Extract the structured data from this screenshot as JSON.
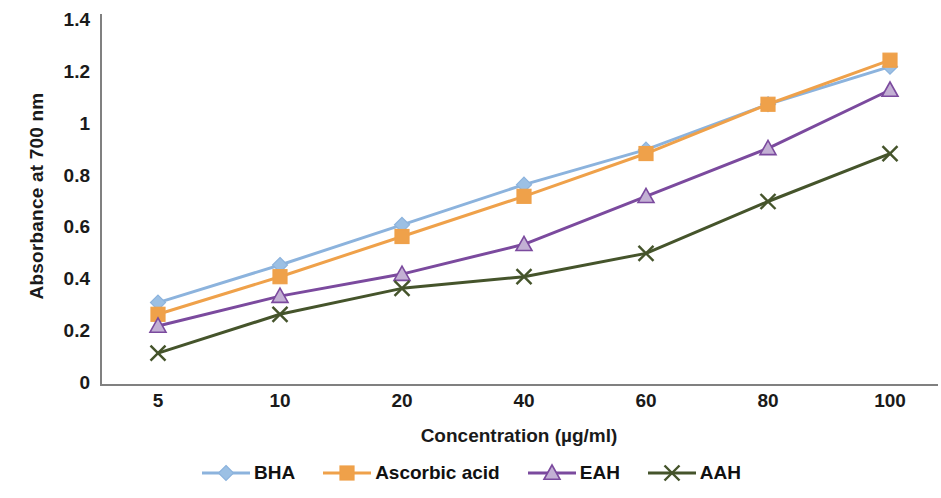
{
  "chart_data": {
    "type": "line",
    "title": "",
    "xlabel": "Concentration (µg/ml)",
    "ylabel": "Absorbance at 700 nm",
    "categories": [
      "5",
      "10",
      "20",
      "40",
      "60",
      "80",
      "100"
    ],
    "x_tick_labels": [
      "5",
      "10",
      "20",
      "40",
      "60",
      "80",
      "100"
    ],
    "y_tick_labels": [
      "0",
      "0.2",
      "0.4",
      "0.6",
      "0.8",
      "1",
      "1.2",
      "1.4"
    ],
    "y_ticks": [
      0,
      0.2,
      0.4,
      0.6,
      0.8,
      1,
      1.2,
      1.4
    ],
    "ylim": [
      0,
      1.4
    ],
    "grid": false,
    "legend_position": "bottom",
    "series": [
      {
        "name": "BHA",
        "color": "#8CB3DD",
        "marker": "diamond",
        "marker_fill": "#9CC0E4",
        "values": [
          0.31,
          0.455,
          0.61,
          0.765,
          0.9,
          1.075,
          1.22
        ]
      },
      {
        "name": "Ascorbic acid",
        "color": "#EFA14A",
        "marker": "square",
        "marker_fill": "#F5A githubA",
        "values": [
          0.265,
          0.41,
          0.565,
          0.72,
          0.885,
          1.075,
          1.245
        ]
      },
      {
        "name": "EAH",
        "color": "#7B4A9E",
        "marker": "triangle",
        "marker_fill": "#B9A3CC",
        "values": [
          0.22,
          0.335,
          0.42,
          0.535,
          0.72,
          0.905,
          1.13
        ]
      },
      {
        "name": "AAH",
        "color": "#45542B",
        "marker": "cross",
        "marker_fill": "#45542B",
        "values": [
          0.115,
          0.265,
          0.365,
          0.41,
          0.5,
          0.7,
          0.885
        ]
      }
    ]
  },
  "legend": {
    "items": [
      {
        "label": "BHA"
      },
      {
        "label": "Ascorbic acid"
      },
      {
        "label": "EAH"
      },
      {
        "label": "AAH"
      }
    ]
  },
  "axes": {
    "y_title": "Absorbance at 700 nm",
    "x_title": "Concentration (µg/ml)"
  }
}
